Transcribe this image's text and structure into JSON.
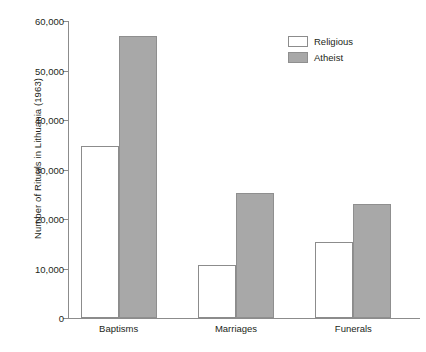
{
  "chart_data": {
    "type": "bar",
    "title": "",
    "xlabel": "",
    "ylabel": "Number of Rituals in Lithuania (1963)",
    "categories": [
      "Baptisms",
      "Marriages",
      "Funerals"
    ],
    "series": [
      {
        "name": "Religious",
        "color": "#ffffff",
        "values": [
          34800,
          10800,
          15300
        ]
      },
      {
        "name": "Atheist",
        "color": "#a8a8a8",
        "values": [
          57000,
          25200,
          23000
        ]
      }
    ],
    "ylim": [
      0,
      60000
    ],
    "yticks": [
      0,
      10000,
      20000,
      30000,
      40000,
      50000,
      60000
    ],
    "ytick_labels": [
      "0",
      "10,000",
      "20,000",
      "30,000",
      "40,000",
      "50,000",
      "60,000"
    ],
    "grid": false,
    "legend_position": "top-right",
    "legend": [
      "Religious",
      "Atheist"
    ]
  },
  "axis": {
    "line_color": "#8c8c8c"
  }
}
